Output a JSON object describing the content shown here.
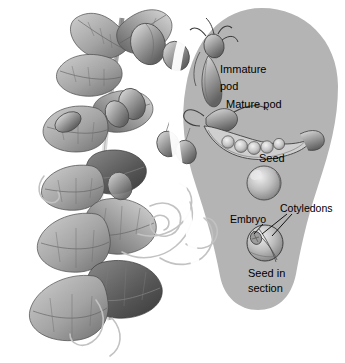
{
  "figure": {
    "kind": "botanical-illustration",
    "background_color": "#ffffff",
    "panel_color": "#b4b4b4",
    "label_color": "#000000"
  },
  "labels": {
    "immature_pod_line1": "Immature",
    "immature_pod_line2": "pod",
    "mature_pod": "Mature pod",
    "seed": "Seed",
    "cotyledons": "Cotyledons",
    "embryo": "Embryo",
    "seed_in_section_line1": "Seed in",
    "seed_in_section_line2": "section"
  },
  "parts": {
    "plant": "bean-plant-with-leaves-pods-tendrils",
    "panel": "gray-rounded-callout-band",
    "immature_pod": "immature-pod-specimen",
    "mature_pod": "opened-mature-pod-with-seeds",
    "seed": "whole-seed",
    "seed_section": "seed-cross-section"
  },
  "mature_pod": {
    "seed_count": 5
  }
}
